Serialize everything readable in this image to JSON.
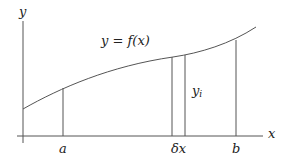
{
  "diagram": {
    "axes": {
      "x_label": "x",
      "y_label": "y"
    },
    "curve_label": "y = f(x)",
    "strip_label": "y",
    "strip_subscript": "i",
    "ticks": {
      "a": "a",
      "dx": "δx",
      "b": "b"
    }
  }
}
